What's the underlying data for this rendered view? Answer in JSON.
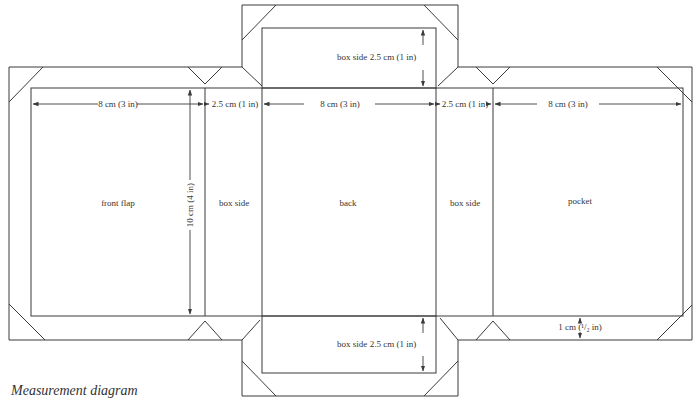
{
  "caption": "Measurement diagram",
  "colors": {
    "line": "#3a3a3a",
    "text": "#333333",
    "background": "#ffffff"
  },
  "panels": {
    "front_flap": "front flap",
    "box_side_left": "box side",
    "back": "back",
    "box_side_right": "box side",
    "pocket": "pocket",
    "box_side_top": "box side",
    "box_side_bottom": "box side"
  },
  "dimensions": {
    "front_flap_width": "8 cm (3 in)",
    "left_side_width": "2.5 cm (1 in)",
    "back_width": "8 cm (3 in)",
    "right_side_width": "2.5 cm (1 in)",
    "pocket_width": "8 cm (3 in)",
    "height": "10 cm (4 in)",
    "top_side_height": "2.5 cm (1 in)",
    "bottom_side_height": "2.5 cm (1 in)",
    "margin": "1 cm (¹/₂ in)"
  }
}
